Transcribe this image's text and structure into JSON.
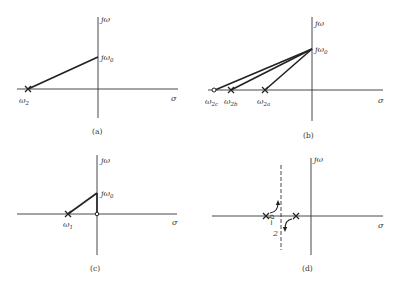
{
  "figure": {
    "panels": [
      {
        "id": "a",
        "caption": "(a)",
        "axis_labels": {
          "imag": "jω",
          "real": "σ"
        },
        "point_labels": {
          "jw0": "jω",
          "jw0_sub": "0",
          "pole": "ω",
          "pole_sub": "2"
        }
      },
      {
        "id": "b",
        "caption": "(b)",
        "axis_labels": {
          "imag": "jω",
          "real": "σ"
        },
        "point_labels": {
          "jw0": "jω",
          "jw0_sub": "0",
          "zero_c": "ω",
          "zero_c_sub": "2c",
          "pole_b": "ω",
          "pole_b_sub": "2b",
          "pole_a": "ω",
          "pole_a_sub": "2a"
        }
      },
      {
        "id": "c",
        "caption": "(c)",
        "axis_labels": {
          "imag": "jω",
          "real": "σ"
        },
        "point_labels": {
          "jw0": "jω",
          "jw0_sub": "0",
          "pole": "ω",
          "pole_sub": "1"
        }
      },
      {
        "id": "d",
        "caption": "(d)",
        "axis_labels": {
          "imag": "jω",
          "real": "σ"
        },
        "point_labels": {
          "asymptote_num": "−b",
          "asymptote_den": "2"
        }
      }
    ],
    "colors": {
      "line": "#222222",
      "text": "#333333",
      "background": "#ffffff"
    }
  }
}
